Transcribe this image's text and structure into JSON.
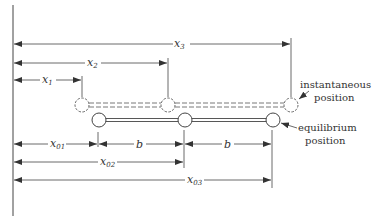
{
  "diagram": {
    "title": "",
    "dimensions_instantaneous": [
      {
        "id": "x1",
        "label": "x",
        "sub": "1"
      },
      {
        "id": "x2",
        "label": "x",
        "sub": "2"
      },
      {
        "id": "x3",
        "label": "x",
        "sub": "3"
      }
    ],
    "dimensions_equilibrium": [
      {
        "id": "x01",
        "label": "x",
        "sub": "01"
      },
      {
        "id": "b1",
        "label": "b"
      },
      {
        "id": "b2",
        "label": "b"
      },
      {
        "id": "x02",
        "label": "x",
        "sub": "02"
      },
      {
        "id": "x03",
        "label": "x",
        "sub": "03"
      }
    ],
    "annotations": {
      "instantaneous_line1": "instantaneous",
      "instantaneous_line2": "position",
      "equilibrium_line1": "equilibrium",
      "equilibrium_line2": "position"
    },
    "colors": {
      "line": "#444444",
      "background": "#ffffff"
    }
  }
}
